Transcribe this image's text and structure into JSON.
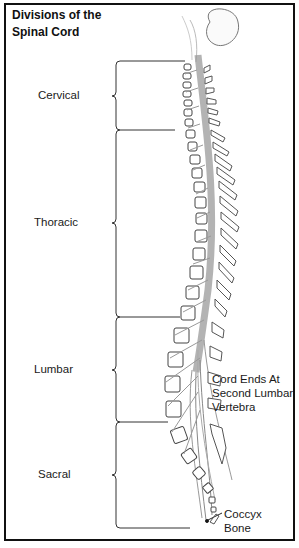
{
  "title": {
    "line1": "Divisions of the",
    "line2": "Spinal Cord"
  },
  "divisions": [
    {
      "label": "Cervical",
      "top": 61,
      "bottom": 130
    },
    {
      "label": "Thoracic",
      "top": 130,
      "bottom": 317
    },
    {
      "label": "Lumbar",
      "top": 317,
      "bottom": 422
    },
    {
      "label": "Sacral",
      "top": 422,
      "bottom": 528
    }
  ],
  "annotations": {
    "cord_end": {
      "line1": "Cord Ends At",
      "line2": "Second Lumbar",
      "line3": "Vertebra"
    },
    "coccyx": {
      "line1": "Coccyx",
      "line2": "Bone"
    }
  },
  "colors": {
    "frame": "#111111",
    "line": "#333333",
    "cord": "#9a9a9a"
  }
}
